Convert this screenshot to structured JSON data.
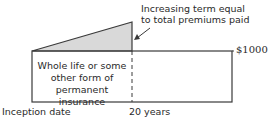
{
  "diagram": {
    "callout": {
      "line1": "Increasing term equal",
      "line2": "to total premiums paid"
    },
    "box_label": {
      "line1": "Whole life or some",
      "line2": "other form of",
      "line3": "permanent insurance"
    },
    "amount_label": "$1000",
    "x_axis": {
      "start_label": "Inception date",
      "end_label": "20 years"
    },
    "colors": {
      "line": "#3a3a3a",
      "triangle_fill": "#d9d9d9",
      "background": "#ffffff"
    }
  }
}
